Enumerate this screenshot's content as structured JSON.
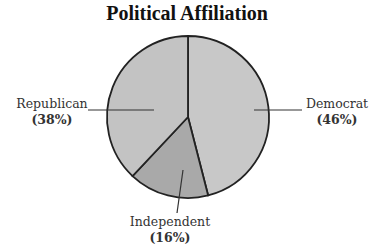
{
  "chart_data": {
    "type": "pie",
    "title": "Political Affiliation",
    "categories": [
      "Democrat",
      "Independent",
      "Republican"
    ],
    "values": [
      46,
      16,
      38
    ],
    "value_labels": [
      "(46%)",
      "(16%)",
      "(38%)"
    ],
    "colors": [
      "#c8c8c8",
      "#a9a9a9",
      "#c3c3c3"
    ],
    "start_angle": "12 o'clock",
    "direction": "clockwise",
    "legend": "none (direct labels with leader lines)"
  }
}
